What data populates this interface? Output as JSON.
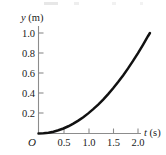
{
  "figure": {
    "origin_label": "O",
    "y_axis_title_var": "y",
    "y_axis_title_unit": " (m)",
    "x_axis_title_var": "t",
    "x_axis_title_unit": " (s)",
    "curve_color": "#111111",
    "axis_color": "#8c8c8c",
    "background_color": "#ffffff"
  },
  "chart_data": {
    "type": "line",
    "title": "",
    "subtitle": "",
    "xlabel": "t (s)",
    "ylabel": "y (m)",
    "xlim": [
      0,
      2.35
    ],
    "ylim": [
      0,
      1.1
    ],
    "grid": false,
    "legend": null,
    "annotations": [],
    "x_ticks": [
      0.5,
      1.0,
      1.5,
      2.0
    ],
    "x_tick_labels": [
      "0.5",
      "1.0",
      "1.5",
      "2.0"
    ],
    "y_ticks": [
      0.2,
      0.4,
      0.6,
      0.8,
      1.0
    ],
    "y_tick_labels": [
      "0.2",
      "0.4",
      "0.6",
      "0.8",
      "1.0"
    ],
    "relationship": "y = 0.2 * t^2",
    "series": [
      {
        "name": "y(t)",
        "color": "#111111",
        "x": [
          0.0,
          0.1,
          0.2,
          0.3,
          0.4,
          0.5,
          0.6,
          0.7,
          0.8,
          0.9,
          1.0,
          1.1,
          1.2,
          1.3,
          1.4,
          1.5,
          1.6,
          1.7,
          1.8,
          1.9,
          2.0,
          2.1,
          2.2,
          2.24
        ],
        "values": [
          0.0,
          0.002,
          0.008,
          0.018,
          0.032,
          0.05,
          0.072,
          0.098,
          0.128,
          0.162,
          0.2,
          0.242,
          0.288,
          0.338,
          0.392,
          0.45,
          0.512,
          0.578,
          0.648,
          0.722,
          0.8,
          0.882,
          0.968,
          1.0
        ]
      }
    ]
  }
}
